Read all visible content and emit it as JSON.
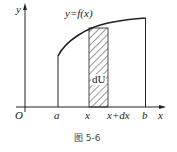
{
  "figure": {
    "caption": "图 5-6",
    "curve_label": "y=f(x)",
    "strip_label": "dU",
    "axes": {
      "x_label": "x",
      "y_label": "y",
      "origin_label": "O"
    },
    "x_ticks": [
      "a",
      "x",
      "x+dx",
      "b"
    ],
    "colors": {
      "stroke": "#222222",
      "hatch": "#333333",
      "background": "#ffffff"
    }
  }
}
